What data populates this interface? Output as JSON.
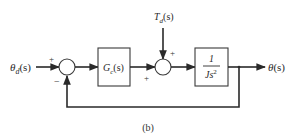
{
  "diagram": {
    "caption": "(b)",
    "input": {
      "symbol": "θ",
      "subscript": "d",
      "arg": "(s)"
    },
    "output": {
      "symbol": "θ",
      "arg": "(s)"
    },
    "disturbance": {
      "symbol": "T",
      "subscript": "d",
      "arg": "(s)"
    },
    "controller": {
      "symbol": "G",
      "subscript": "c",
      "arg": "(s)"
    },
    "plant": {
      "numerator": "1",
      "denominator": "Js",
      "exponent": "2"
    },
    "sum1": {
      "plus_sign": "+",
      "minus_sign": "−"
    },
    "sum2": {
      "plus_left": "+",
      "plus_top": "+"
    },
    "colors": {
      "line": "#2a2a2a",
      "box": "#3a3a3a",
      "background": "#ffffff"
    }
  }
}
